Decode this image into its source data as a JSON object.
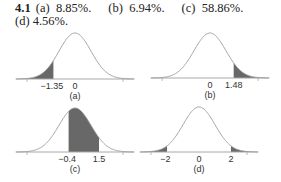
{
  "answer": {
    "number": "4.1",
    "parts": [
      {
        "label": "(a)",
        "value": "8.85%."
      },
      {
        "label": "(b)",
        "value": "6.94%."
      },
      {
        "label": "(c)",
        "value": "58.86%."
      },
      {
        "label": "(d)",
        "value": "4.56%."
      }
    ]
  },
  "chart_data": [
    {
      "type": "area",
      "title": "(a)",
      "distribution": "standard normal",
      "shaded_region": {
        "from": "-inf",
        "to": -1.35
      },
      "tick_labels": [
        "-1.35",
        "0"
      ],
      "xlim": [
        -3.5,
        3.5
      ],
      "area_percent": 8.85
    },
    {
      "type": "area",
      "title": "(b)",
      "distribution": "standard normal",
      "shaded_region": {
        "from": 1.48,
        "to": "inf"
      },
      "tick_labels": [
        "0",
        "1.48"
      ],
      "xlim": [
        -3.5,
        3.5
      ],
      "area_percent": 6.94
    },
    {
      "type": "area",
      "title": "(c)",
      "distribution": "standard normal",
      "shaded_region": {
        "from": -0.4,
        "to": 1.5
      },
      "tick_labels": [
        "-0.4",
        "1.5"
      ],
      "xlim": [
        -3.5,
        3.5
      ],
      "area_percent": 58.86
    },
    {
      "type": "area",
      "title": "(d)",
      "distribution": "standard normal",
      "shaded_region": [
        {
          "from": "-inf",
          "to": -2
        },
        {
          "from": 2,
          "to": "inf"
        }
      ],
      "tick_labels": [
        "-2",
        "0",
        "2"
      ],
      "xlim": [
        -3.5,
        3.5
      ],
      "area_percent": 4.56
    }
  ],
  "panels": {
    "a": {
      "caption": "(a)",
      "ticks": [
        "-1.35",
        "0"
      ]
    },
    "b": {
      "caption": "(b)",
      "ticks": [
        "0",
        "1.48"
      ]
    },
    "c": {
      "caption": "(c)",
      "ticks": [
        "-0.4",
        "1.5"
      ]
    },
    "d": {
      "caption": "(d)",
      "ticks": [
        "-2",
        "0",
        "2"
      ]
    }
  }
}
